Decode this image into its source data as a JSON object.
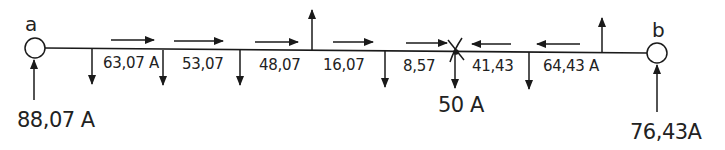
{
  "diagram": {
    "type": "two-end-fed distribution line current diagram",
    "nodes": [
      {
        "id": "a",
        "label": "a",
        "feed_current": "88,07 A"
      },
      {
        "id": "b",
        "label": "b",
        "feed_current": "76,43A"
      }
    ],
    "segment_currents": [
      {
        "label": "63,07 A",
        "direction": "right"
      },
      {
        "label": "53,07",
        "direction": "right"
      },
      {
        "label": "48,07",
        "direction": "right"
      },
      {
        "label": "16,07",
        "direction": "right"
      },
      {
        "label": "8,57",
        "direction": "right"
      },
      {
        "label": "41,43",
        "direction": "left"
      },
      {
        "label": "64,43 A",
        "direction": "left"
      }
    ],
    "low_point": {
      "label": "50 A",
      "marker": "cross"
    },
    "colors": {
      "line": "#1a1a1a",
      "background": "#ffffff"
    }
  }
}
